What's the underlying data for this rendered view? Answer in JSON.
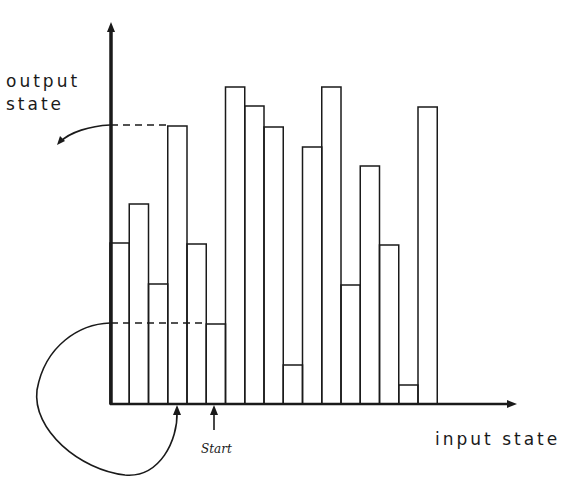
{
  "diagram": {
    "y_axis_label_line1": "output",
    "y_axis_label_line2": "state",
    "x_axis_label": "input state",
    "start_label": "Start",
    "stroke_color": "#1a1a1a",
    "background": "#ffffff"
  },
  "chart_data": {
    "type": "bar",
    "title": "",
    "xlabel": "input state",
    "ylabel": "output state",
    "categories": [
      "1",
      "2",
      "3",
      "4",
      "5",
      "6",
      "7",
      "8",
      "9",
      "10",
      "11",
      "12",
      "13",
      "14",
      "15",
      "16",
      "17"
    ],
    "values": [
      161,
      200,
      120,
      278,
      160,
      80,
      317,
      298,
      277,
      39,
      257,
      317,
      119,
      238,
      159,
      19,
      297
    ],
    "annotations": [
      {
        "text": "Start",
        "points_to_bar": 6
      },
      {
        "type": "dashed-line",
        "level": 80,
        "note": "height of start bar projected to y-axis, curved arrow maps it back to input axis at bar 4/5 boundary"
      },
      {
        "type": "dashed-line",
        "level": 278,
        "note": "height of bar 4 projected to y-axis with outgoing arrow"
      }
    ],
    "grid": false,
    "legend": false
  }
}
